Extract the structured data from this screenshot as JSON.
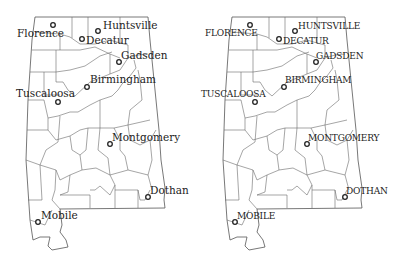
{
  "maps": [
    {
      "style": "title-case",
      "cities": {
        "florence": "Florence",
        "huntsville": "Huntsville",
        "decatur": "Decatur",
        "gadsden": "Gadsden",
        "birmingham": "Birmingham",
        "tuscaloosa": "Tuscaloosa",
        "montgomery": "Montgomery",
        "dothan": "Dothan",
        "mobile": "Mobile"
      }
    },
    {
      "style": "upper-case",
      "cities": {
        "florence": "FLORENCE",
        "huntsville": "HUNTSVILLE",
        "decatur": "DECATUR",
        "gadsden": "GADSDEN",
        "birmingham": "BIRMINGHAM",
        "tuscaloosa": "TUSCALOOSA",
        "montgomery": "MONTGOMERY",
        "dothan": "DOTHAN",
        "mobile": "MOBILE"
      }
    }
  ],
  "colors": {
    "background": "#ffffff",
    "county_lines": "#6a6a6a",
    "text": "#222222"
  }
}
